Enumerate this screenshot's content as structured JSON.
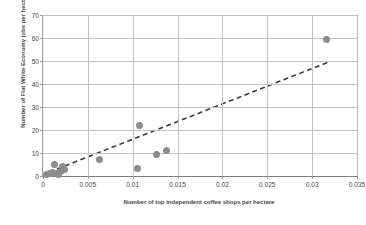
{
  "chart_data": {
    "type": "scatter",
    "title": "",
    "xlabel": "Number of top independent coffee shops per hectare",
    "ylabel": "Number of Flat White Economy jobs per hectare",
    "xlim": [
      0,
      0.035
    ],
    "ylim": [
      0,
      70
    ],
    "xticks": [
      0,
      0.005,
      0.01,
      0.015,
      0.02,
      0.025,
      0.03,
      0.035
    ],
    "xtick_labels": [
      "0",
      "0.005",
      "0.01",
      "0.015",
      "0.02",
      "0.025",
      "0.03",
      "0.035"
    ],
    "yticks": [
      0,
      10,
      20,
      30,
      40,
      50,
      60,
      70
    ],
    "ytick_labels": [
      "0",
      "10",
      "20",
      "30",
      "40",
      "50",
      "60",
      "70"
    ],
    "grid": "both",
    "legend": "none",
    "marker_color": "#8c8c8c",
    "trendline_color": "#3a3a3a",
    "trendline_style": "dashed",
    "points": [
      {
        "x": 0.00035,
        "y": 0.7
      },
      {
        "x": 0.00075,
        "y": 1.2
      },
      {
        "x": 0.00105,
        "y": 1.6
      },
      {
        "x": 0.0013,
        "y": 5.0
      },
      {
        "x": 0.00145,
        "y": 1.0
      },
      {
        "x": 0.00175,
        "y": 0.8
      },
      {
        "x": 0.0019,
        "y": 2.0
      },
      {
        "x": 0.0022,
        "y": 4.3
      },
      {
        "x": 0.00245,
        "y": 3.0
      },
      {
        "x": 0.0063,
        "y": 7.0
      },
      {
        "x": 0.0105,
        "y": 3.4
      },
      {
        "x": 0.0108,
        "y": 22.0
      },
      {
        "x": 0.0127,
        "y": 9.2
      },
      {
        "x": 0.01375,
        "y": 11.2
      },
      {
        "x": 0.0316,
        "y": 59.5
      }
    ],
    "trendline": {
      "x0": 0.00155,
      "y0": 3.0,
      "x1": 0.0318,
      "y1": 49.5
    }
  }
}
